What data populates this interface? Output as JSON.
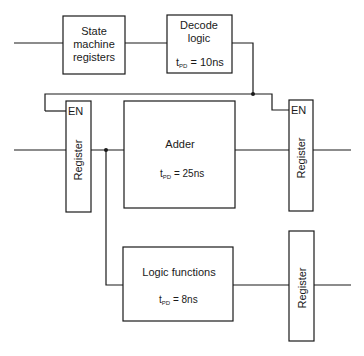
{
  "diagram": {
    "blocks": {
      "state_machine": {
        "line1": "State",
        "line2": "machine",
        "line3": "registers"
      },
      "decode": {
        "line1": "Decode",
        "line2": "logic",
        "tpd_prefix": "t",
        "tpd_sub": "PD",
        "tpd_value": " = 10ns"
      },
      "adder": {
        "title": "Adder",
        "tpd_prefix": "t",
        "tpd_sub": "PD",
        "tpd_value": " = 25ns"
      },
      "logic_functions": {
        "title": "Logic functions",
        "tpd_prefix": "t",
        "tpd_sub": "PD",
        "tpd_value": " = 8ns"
      },
      "register_left": {
        "label": "Register",
        "enable": "EN"
      },
      "register_right": {
        "label": "Register",
        "enable": "EN"
      },
      "register_bottom": {
        "label": "Register"
      }
    },
    "colors": {
      "stroke": "#1a1a1a",
      "background": "#ffffff"
    }
  }
}
